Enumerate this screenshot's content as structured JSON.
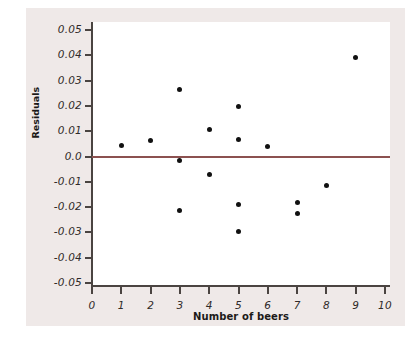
{
  "chart_data": {
    "type": "scatter",
    "title": "",
    "xlabel": "Number of beers",
    "ylabel": "Residuals",
    "xlim": [
      0,
      10
    ],
    "ylim": [
      -0.05,
      0.05
    ],
    "xticks": [
      "0",
      "1",
      "2",
      "3",
      "4",
      "5",
      "6",
      "7",
      "8",
      "9",
      "10"
    ],
    "xtick_values": [
      0,
      1,
      2,
      3,
      4,
      5,
      6,
      7,
      8,
      9,
      10
    ],
    "yticks": [
      "0.05",
      "0.04",
      "0.03",
      "0.02",
      "0.01",
      "0.0",
      "-0.01",
      "-0.02",
      "-0.03",
      "-0.04",
      "-0.05"
    ],
    "ytick_values": [
      0.05,
      0.04,
      0.03,
      0.02,
      0.01,
      0.0,
      -0.01,
      -0.02,
      -0.03,
      -0.04,
      -0.05
    ],
    "grid": false,
    "legend": "none",
    "reference_line": {
      "name": "zero-residual-line",
      "y": 0.0,
      "color": "#8c5150"
    },
    "marker_color": "#111111",
    "points": [
      {
        "x": 1,
        "y": 0.0045
      },
      {
        "x": 2,
        "y": 0.0063
      },
      {
        "x": 3,
        "y": 0.0265
      },
      {
        "x": 3,
        "y": -0.0017
      },
      {
        "x": 3,
        "y": -0.0212
      },
      {
        "x": 4,
        "y": 0.0108
      },
      {
        "x": 4,
        "y": -0.0072
      },
      {
        "x": 5,
        "y": 0.0197
      },
      {
        "x": 5,
        "y": 0.0068
      },
      {
        "x": 5,
        "y": -0.0191
      },
      {
        "x": 5,
        "y": -0.0295
      },
      {
        "x": 6,
        "y": 0.004
      },
      {
        "x": 7,
        "y": -0.018
      },
      {
        "x": 7,
        "y": -0.0226
      },
      {
        "x": 8,
        "y": -0.0115
      },
      {
        "x": 9,
        "y": 0.0393
      }
    ]
  },
  "figure": {
    "panel_color": "#efe9e8",
    "canvas_color": "#ffffff",
    "axis_color": "#4a4441"
  }
}
